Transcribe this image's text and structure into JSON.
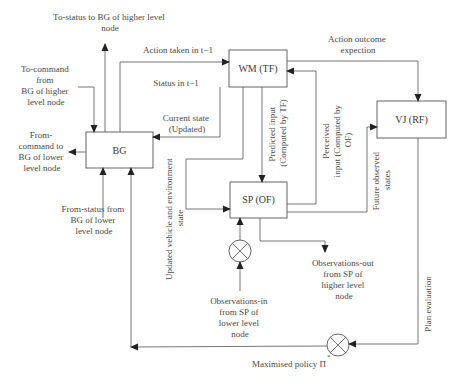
{
  "diagram": {
    "nodes": {
      "bg": "BG",
      "wm": "WM (TF)",
      "vj": "VJ (RF)",
      "sp": "SP (OF)"
    },
    "labels": {
      "to_status": [
        "To-status to BG of higher level",
        "node"
      ],
      "to_command": [
        "To-command",
        "from",
        "BG of higher",
        "level node"
      ],
      "from_command": [
        "From-",
        "command to",
        "BG of lower",
        "level node"
      ],
      "from_status": [
        "From-status from",
        "BG of lower",
        "level node"
      ],
      "action_taken": "Action taken in t−1",
      "status": "Status in t−1",
      "current_state": [
        "Current state",
        "(Updated)"
      ],
      "updated_vehicle": [
        "Updated vehicle and environment",
        "state"
      ],
      "predicted_input": [
        "Predicted input",
        "(Computed by TF)"
      ],
      "perceived_input": [
        "Perceived",
        "input (Computed by",
        "OF)"
      ],
      "future_states": [
        "Future observed",
        "states"
      ],
      "action_outcome": [
        "Action outcome",
        "expection"
      ],
      "obs_out": [
        "Observations-out",
        "from SP of",
        "higher level",
        "node"
      ],
      "obs_in": [
        "Observations-in",
        "from SP of",
        "lower level",
        "node"
      ],
      "plan_eval": "Plan evaluation",
      "max_policy": "Maximised policy Π",
      "max_policy_sup": "*"
    }
  }
}
